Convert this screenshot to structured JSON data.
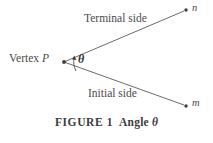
{
  "figure": {
    "caption_number": "FIGURE 1",
    "caption_text": "Angle",
    "caption_symbol": "θ"
  },
  "diagram": {
    "vertex_label_prefix": "Vertex",
    "vertex_label_point": "P",
    "terminal_side_label": "Terminal side",
    "initial_side_label": "Initial side",
    "angle_symbol": "θ",
    "ray_upper_label": "n",
    "ray_lower_label": "m",
    "colors": {
      "line": "#555555",
      "text": "#4a4a4a",
      "background": "#ffffff"
    }
  }
}
